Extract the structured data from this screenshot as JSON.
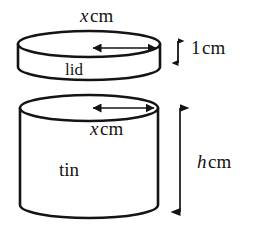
{
  "figure": {
    "background_color": "#ffffff",
    "stroke_color": "#141414",
    "fill_color": "#ffffff",
    "width": 255,
    "height": 246
  },
  "labels": {
    "lid_diameter_var": "x",
    "lid_diameter_unit": "cm",
    "lid_height_value": "1",
    "lid_height_unit": "cm",
    "lid_name": "lid",
    "tin_diameter_var": "x",
    "tin_diameter_unit": "cm",
    "tin_name": "tin",
    "tin_height_var": "h",
    "tin_height_unit": "cm"
  },
  "shapes": {
    "lid": {
      "name": "lid",
      "type": "cylinder",
      "center_x": 89,
      "top_ellipse_cy": 44,
      "rx": 71,
      "ry": 13,
      "body_height": 23
    },
    "tin": {
      "name": "tin",
      "type": "cylinder",
      "center_x": 89,
      "top_ellipse_cy": 108,
      "rx": 69,
      "ry": 13,
      "body_height": 107
    }
  },
  "arrows": {
    "lid_diameter": {
      "name": "lid-diameter-arrow",
      "orientation": "horizontal",
      "x1": 89,
      "x2": 160,
      "y": 48
    },
    "lid_height": {
      "name": "lid-height-arrow",
      "orientation": "vertical",
      "x": 178,
      "y1": 38,
      "y2": 66
    },
    "tin_diameter": {
      "name": "tin-diameter-arrow",
      "orientation": "horizontal",
      "x1": 89,
      "x2": 158,
      "y": 108
    },
    "tin_height": {
      "name": "tin-height-arrow",
      "orientation": "vertical",
      "x": 180,
      "y1": 104,
      "y2": 216
    }
  }
}
